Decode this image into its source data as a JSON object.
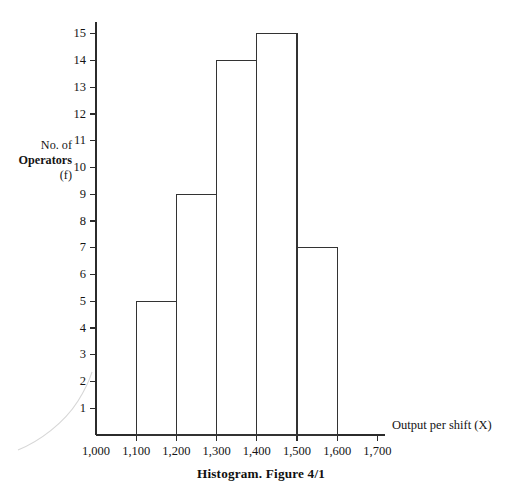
{
  "figure": {
    "caption": "Histogram. Figure 4/1",
    "y_axis_title_lines": [
      "No. of",
      "Operators",
      "(f)"
    ],
    "x_axis_title": "Output per shift (X)"
  },
  "chart_data": {
    "type": "bar",
    "title": "Histogram. Figure 4/1",
    "xlabel": "Output per shift (X)",
    "ylabel": "No. of Operators (f)",
    "xlim": [
      1000,
      1700
    ],
    "ylim": [
      0,
      15
    ],
    "grid": false,
    "legend": null,
    "bin_width": 100,
    "x_tick_labels": [
      "1,000",
      "1,100",
      "1,200",
      "1,300",
      "1,400",
      "1,500",
      "1,600",
      "1,700"
    ],
    "x_tick_values": [
      1000,
      1100,
      1200,
      1300,
      1400,
      1500,
      1600,
      1700
    ],
    "y_tick_labels": [
      "1",
      "2",
      "3",
      "4",
      "5",
      "6",
      "7",
      "8",
      "9",
      "10",
      "11",
      "12",
      "13",
      "14",
      "15"
    ],
    "y_tick_values": [
      1,
      2,
      3,
      4,
      5,
      6,
      7,
      8,
      9,
      10,
      11,
      12,
      13,
      14,
      15
    ],
    "bins": [
      {
        "label": "1,100-1,200",
        "x_start": 1100,
        "x_end": 1200,
        "value": 5
      },
      {
        "label": "1,200-1,300",
        "x_start": 1200,
        "x_end": 1300,
        "value": 9
      },
      {
        "label": "1,300-1,400",
        "x_start": 1300,
        "x_end": 1400,
        "value": 14
      },
      {
        "label": "1,400-1,500",
        "x_start": 1400,
        "x_end": 1500,
        "value": 15
      },
      {
        "label": "1,500-1,600",
        "x_start": 1500,
        "x_end": 1600,
        "value": 7
      }
    ],
    "categories": [
      "1,100-1,200",
      "1,200-1,300",
      "1,300-1,400",
      "1,400-1,500",
      "1,500-1,600"
    ],
    "values": [
      5,
      9,
      14,
      15,
      7
    ],
    "colors": {
      "bar_stroke": "#333333",
      "bar_fill": "none",
      "axis": "#2b2b2b",
      "text": "#141414",
      "background": "#ffffff"
    }
  }
}
